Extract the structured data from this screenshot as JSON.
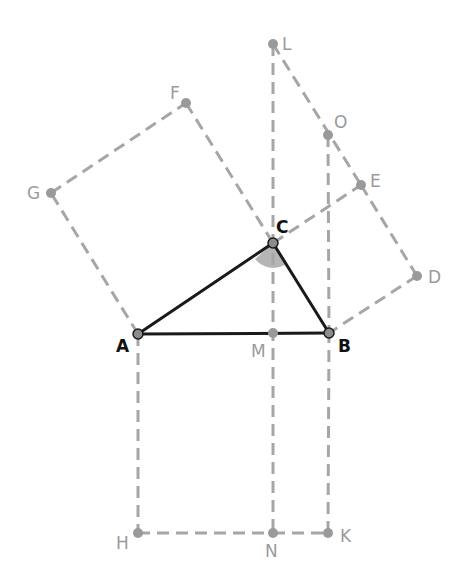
{
  "diagram": {
    "triangle": [
      "A",
      "B",
      "C"
    ],
    "right_angle_vertex": "C",
    "points": {
      "A": {
        "label": "A",
        "role": "main"
      },
      "B": {
        "label": "B",
        "role": "main"
      },
      "C": {
        "label": "C",
        "role": "main"
      },
      "D": {
        "label": "D",
        "role": "aux"
      },
      "E": {
        "label": "E",
        "role": "aux"
      },
      "F": {
        "label": "F",
        "role": "aux"
      },
      "G": {
        "label": "G",
        "role": "aux"
      },
      "H": {
        "label": "H",
        "role": "aux"
      },
      "K": {
        "label": "K",
        "role": "aux"
      },
      "L": {
        "label": "L",
        "role": "aux"
      },
      "M": {
        "label": "M",
        "role": "aux"
      },
      "N": {
        "label": "N",
        "role": "aux"
      },
      "O": {
        "label": "O",
        "role": "aux"
      }
    },
    "solid_segments": [
      [
        "A",
        "B"
      ],
      [
        "B",
        "C"
      ],
      [
        "C",
        "A"
      ]
    ],
    "dashed_segments": [
      [
        "A",
        "G"
      ],
      [
        "G",
        "F"
      ],
      [
        "F",
        "C"
      ],
      [
        "C",
        "E"
      ],
      [
        "E",
        "D"
      ],
      [
        "D",
        "B"
      ],
      [
        "A",
        "H"
      ],
      [
        "H",
        "N"
      ],
      [
        "N",
        "K"
      ],
      [
        "K",
        "B"
      ],
      [
        "L",
        "M"
      ],
      [
        "M",
        "N"
      ],
      [
        "L",
        "O"
      ],
      [
        "O",
        "E"
      ],
      [
        "O",
        "B"
      ]
    ],
    "colors": {
      "solid": "#1a1a1a",
      "dashed": "#a6a6a6",
      "angle_mark": "#b5b5b5"
    }
  }
}
